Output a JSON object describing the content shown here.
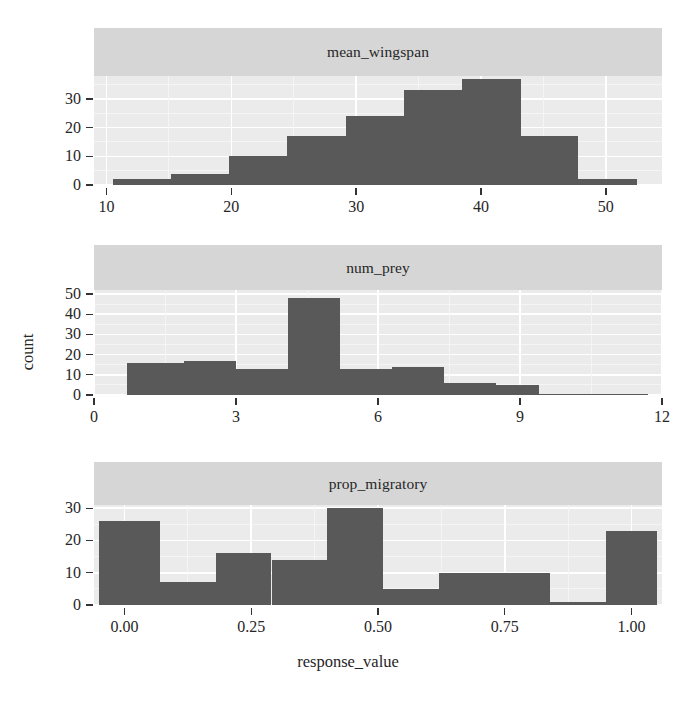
{
  "figure": {
    "type": "faceted-histogram",
    "axis_titles": {
      "x": "response_value",
      "y": "count"
    },
    "colors": {
      "bar": "#595959",
      "panel_background": "#ebebeb",
      "strip_background": "#d6d6d6",
      "gridline": "#ffffff",
      "text": "#262626"
    }
  },
  "chart_data": [
    {
      "type": "bar",
      "title": "mean_wingspan",
      "xlabel": "response_value",
      "ylabel": "count",
      "xlim": [
        9.0,
        54.5
      ],
      "ylim": [
        0,
        38
      ],
      "xticks": [
        10,
        20,
        30,
        40,
        50
      ],
      "xtick_labels": [
        "10",
        "20",
        "30",
        "40",
        "50"
      ],
      "yticks": [
        0,
        10,
        20,
        30
      ],
      "ytick_labels": [
        "0",
        "10",
        "20",
        "30"
      ],
      "grid": true,
      "legend": "none",
      "bin_edges": [
        10.5,
        15.2,
        19.8,
        24.5,
        29.2,
        33.8,
        38.5,
        43.2,
        47.8,
        52.5
      ],
      "bin_centers": [
        12.8,
        17.5,
        22.1,
        26.8,
        31.5,
        36.1,
        40.8,
        45.5,
        50.1
      ],
      "values": [
        2,
        4,
        10,
        17,
        24,
        33,
        37,
        17,
        2
      ]
    },
    {
      "type": "bar",
      "title": "num_prey",
      "xlabel": "response_value",
      "ylabel": "count",
      "xlim": [
        0,
        12
      ],
      "ylim": [
        0,
        52
      ],
      "xticks": [
        0,
        3,
        6,
        9,
        12
      ],
      "xtick_labels": [
        "0",
        "3",
        "6",
        "9",
        "12"
      ],
      "yticks": [
        0,
        10,
        20,
        30,
        40,
        50
      ],
      "ytick_labels": [
        "0",
        "10",
        "20",
        "30",
        "40",
        "50"
      ],
      "grid": true,
      "legend": "none",
      "bin_edges": [
        0.7,
        1.9,
        3.0,
        4.1,
        5.2,
        6.3,
        7.4,
        8.5,
        9.4,
        11.7
      ],
      "bin_centers": [
        1.3,
        2.4,
        3.5,
        4.6,
        5.7,
        6.8,
        7.9,
        9.0,
        10.5
      ],
      "values": [
        16,
        17,
        13,
        48,
        13,
        14,
        6,
        5,
        0
      ]
    },
    {
      "type": "bar",
      "title": "prop_migratory",
      "xlabel": "response_value",
      "ylabel": "count",
      "xlim": [
        -0.06,
        1.06
      ],
      "ylim": [
        0,
        31
      ],
      "xticks": [
        0.0,
        0.25,
        0.5,
        0.75,
        1.0
      ],
      "xtick_labels": [
        "0.00",
        "0.25",
        "0.50",
        "0.75",
        "1.00"
      ],
      "yticks": [
        0,
        10,
        20,
        30
      ],
      "ytick_labels": [
        "0",
        "10",
        "20",
        "30"
      ],
      "grid": true,
      "legend": "none",
      "bin_edges": [
        -0.05,
        0.07,
        0.18,
        0.29,
        0.4,
        0.51,
        0.62,
        0.73,
        0.84,
        0.95,
        1.05
      ],
      "bin_centers": [
        0.01,
        0.125,
        0.235,
        0.345,
        0.455,
        0.565,
        0.675,
        0.785,
        0.895,
        1.0
      ],
      "values": [
        26,
        7,
        16,
        14,
        30,
        5,
        10,
        10,
        1,
        23
      ]
    }
  ]
}
